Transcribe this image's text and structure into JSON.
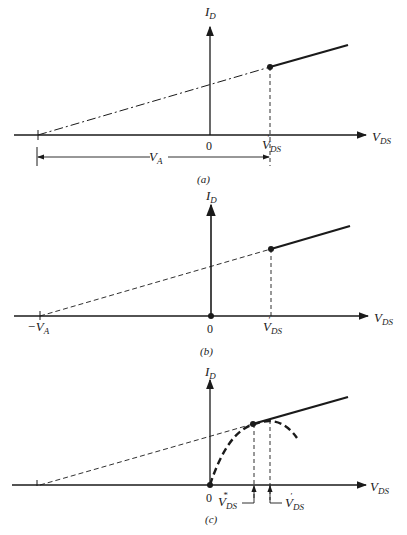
{
  "figure": {
    "panels": [
      {
        "caption": "(a)",
        "y_axis_label": "I",
        "y_axis_sub": "D",
        "x_axis_label": "V",
        "x_axis_sub": "DS",
        "origin_label": "0",
        "point_label": "V",
        "point_sub": "DS",
        "point_prime": "′",
        "span_label": "V",
        "span_sub": "A"
      },
      {
        "caption": "(b)",
        "y_axis_label": "I",
        "y_axis_sub": "D",
        "x_axis_label": "V",
        "x_axis_sub": "DS",
        "origin_label": "0",
        "point_label": "V",
        "point_sub": "DS",
        "point_prime": "′",
        "intercept_label": "−V",
        "intercept_sub": "A"
      },
      {
        "caption": "(c)",
        "y_axis_label": "I",
        "y_axis_sub": "D",
        "x_axis_label": "V",
        "x_axis_sub": "DS",
        "origin_label": "0",
        "star_label": "V",
        "star_sub": "DS",
        "star_sup": "*",
        "point_label": "V",
        "point_sub": "DS",
        "point_prime": "′"
      }
    ],
    "colors": {
      "ink": "#1a1a1a",
      "background": "#ffffff"
    }
  }
}
